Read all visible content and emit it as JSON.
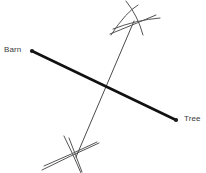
{
  "diagram": {
    "type": "geometric-construction",
    "background_color": "#ffffff",
    "points": [
      {
        "id": "barn",
        "label": "Barn",
        "dot_x": 32,
        "dot_y": 51,
        "label_x": 4,
        "label_y": 45,
        "color": "#1a1a1a"
      },
      {
        "id": "tree",
        "label": "Tree",
        "dot_x": 176,
        "dot_y": 120,
        "label_x": 184,
        "label_y": 114,
        "color": "#1a1a1a"
      }
    ],
    "segment": {
      "id": "barn-tree-segment",
      "x1": 32,
      "y1": 51,
      "x2": 176,
      "y2": 120,
      "stroke": "#111111",
      "stroke_width": 2.6
    },
    "bisector": {
      "id": "perpendicular-bisector",
      "x1": 134,
      "y1": 21,
      "x2": 76,
      "y2": 157,
      "stroke": "#4a4a4a",
      "stroke_width": 1
    },
    "midpoint": {
      "x": 104,
      "y": 86
    },
    "arcs": [
      {
        "id": "arc-top-from-barn",
        "d": "M 111 35 Q 126 12 138 5",
        "stroke": "#555555",
        "stroke_width": 1
      },
      {
        "id": "arc-top-from-tree",
        "d": "M 113 29 Q 136 20 160 18",
        "stroke": "#555555",
        "stroke_width": 1
      },
      {
        "id": "arc-top-cross-a",
        "d": "M 126 1 Q 138 16 143 35",
        "stroke": "#555555",
        "stroke_width": 1
      },
      {
        "id": "arc-top-cross-b",
        "d": "M 110 34 Q 130 26 156 15",
        "stroke": "#555555",
        "stroke_width": 1
      },
      {
        "id": "arc-bottom-from-barn",
        "d": "M 69 138 Q 76 156 82 172",
        "stroke": "#555555",
        "stroke_width": 1
      },
      {
        "id": "arc-bottom-from-tree",
        "d": "M 42 170 Q 70 156 99 143",
        "stroke": "#555555",
        "stroke_width": 1
      },
      {
        "id": "arc-bottom-cross-a",
        "d": "M 64 136 Q 73 154 81 173",
        "stroke": "#555555",
        "stroke_width": 1
      },
      {
        "id": "arc-bottom-cross-b",
        "d": "M 44 166 Q 72 154 97 142",
        "stroke": "#555555",
        "stroke_width": 1
      }
    ]
  }
}
